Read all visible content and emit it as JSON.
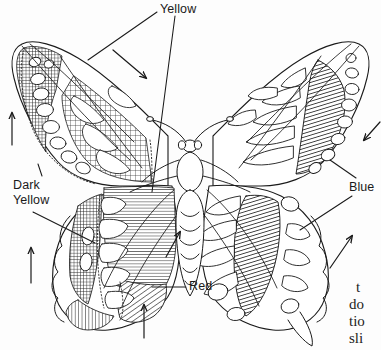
{
  "figure": {
    "background_color": "#ffffff",
    "ink_color": "#1a1a1a"
  },
  "labels": [
    {
      "id": "yellow",
      "text": "Yellow",
      "x": 160,
      "y": 4,
      "points_to": [
        "left forewing cross-hatched band",
        "left hindwing horizontal-hatched band"
      ]
    },
    {
      "id": "dark-yellow",
      "text": "Dark\nYellow",
      "line1": "Dark",
      "line2": "Yellow",
      "x": 13,
      "y": 181,
      "points_to": [
        "left forewing inner margin",
        "left hindwing dense cross-hatch band"
      ]
    },
    {
      "id": "red",
      "text": "Red",
      "x": 189,
      "y": 281,
      "points_to": [
        "left hindwing lower diagonal-hatched patch"
      ]
    },
    {
      "id": "blue",
      "text": "Blue",
      "x": 349,
      "y": 182,
      "points_to": [
        "right forewing diagonal-hatched band",
        "right hindwing diagonal-hatched band"
      ]
    }
  ],
  "arrows": [
    {
      "id": "arrow-left-upper",
      "direction": "up",
      "x": 12,
      "y": 128
    },
    {
      "id": "arrow-left-lower",
      "direction": "up",
      "x": 31,
      "y": 262
    },
    {
      "id": "arrow-top-center",
      "direction": "down-right",
      "x": 128,
      "y": 58
    },
    {
      "id": "arrow-bottom-center",
      "direction": "up",
      "x": 144,
      "y": 315
    },
    {
      "id": "arrow-center-right-hind",
      "direction": "up-right",
      "x": 176,
      "y": 240
    },
    {
      "id": "arrow-right-edge",
      "direction": "down-left",
      "x": 372,
      "y": 128
    },
    {
      "id": "arrow-right-hind",
      "direction": "up-right",
      "x": 338,
      "y": 248
    }
  ],
  "page_text_fragments": [
    {
      "id": "frag-1",
      "text": "t",
      "x": 356,
      "y": 281
    },
    {
      "id": "frag-2",
      "text": "do",
      "x": 349,
      "y": 298
    },
    {
      "id": "frag-3",
      "text": "tio",
      "x": 349,
      "y": 315
    },
    {
      "id": "frag-4",
      "text": "sli",
      "x": 349,
      "y": 332
    }
  ],
  "legend_patterns": [
    {
      "name": "Yellow",
      "pattern": "fine cross-hatch (grid) fill"
    },
    {
      "name": "Dark Yellow",
      "pattern": "dense cross-hatch fill"
    },
    {
      "name": "Red",
      "pattern": "diagonal hatch, lower hindwing patch"
    },
    {
      "name": "Blue",
      "pattern": "heavy diagonal hatch band"
    }
  ]
}
